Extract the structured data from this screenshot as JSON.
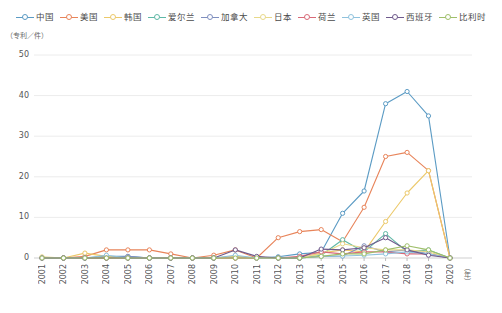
{
  "chart_data": {
    "type": "line",
    "title": "",
    "xlabel": "（年）",
    "ylabel": "（专利／件）",
    "ylim": [
      0,
      55
    ],
    "yticks": [
      0,
      10,
      20,
      30,
      40,
      50
    ],
    "grid": true,
    "legend_position": "top",
    "marker": "open-circle",
    "categories": [
      "2001",
      "2002",
      "2003",
      "2004",
      "2005",
      "2006",
      "2007",
      "2008",
      "2009",
      "2010",
      "2011",
      "2012",
      "2013",
      "2014",
      "2015",
      "2016",
      "2017",
      "2018",
      "2019",
      "2020"
    ],
    "series": [
      {
        "name": "中国",
        "color": "#5b9bc4",
        "values": [
          0,
          0,
          0,
          0.4,
          0.4,
          0,
          0,
          0,
          0,
          0.3,
          0,
          0.3,
          1,
          1.4,
          11,
          16.5,
          38,
          41,
          35,
          0
        ]
      },
      {
        "name": "美国",
        "color": "#e8845a",
        "values": [
          0,
          0,
          0.4,
          2,
          2,
          2,
          1,
          0,
          0.7,
          2,
          0,
          5,
          6.5,
          7,
          4,
          12.5,
          25,
          26,
          21.5,
          0
        ]
      },
      {
        "name": "韩国",
        "color": "#ecc96a",
        "values": [
          0,
          0,
          1.2,
          0.4,
          0,
          0,
          0,
          0,
          0,
          0.4,
          0,
          0,
          0,
          1.2,
          2,
          1.5,
          9,
          16,
          21.5,
          0
        ]
      },
      {
        "name": "爱尔兰",
        "color": "#5fb8a6",
        "values": [
          0,
          0,
          0,
          0,
          0,
          0,
          0,
          0,
          0,
          0,
          0,
          0,
          0,
          0.7,
          4.5,
          1.5,
          6,
          1.5,
          2,
          0
        ]
      },
      {
        "name": "加拿大",
        "color": "#7f8fbf",
        "values": [
          0,
          0,
          0,
          0,
          0.4,
          0,
          0,
          0,
          0,
          0,
          0,
          0,
          0,
          0.4,
          0.5,
          3,
          1.5,
          2,
          1,
          0
        ]
      },
      {
        "name": "日本",
        "color": "#e8d98a",
        "values": [
          0.3,
          0,
          0,
          0,
          0,
          0,
          0,
          0,
          0,
          0,
          0,
          0,
          0,
          1,
          3.5,
          2.5,
          2,
          2,
          1.5,
          0
        ]
      },
      {
        "name": "荷兰",
        "color": "#d96a78",
        "values": [
          0,
          0,
          0,
          0,
          0,
          0,
          0,
          0,
          0,
          0,
          0,
          0,
          0.4,
          1.5,
          1,
          1.5,
          1.5,
          1,
          1,
          0
        ]
      },
      {
        "name": "英国",
        "color": "#8fc2dd",
        "values": [
          0,
          0,
          0,
          0.7,
          0,
          0,
          0,
          0,
          0,
          0.7,
          0,
          0,
          0,
          0.4,
          0.5,
          0.7,
          1,
          1.5,
          1,
          0
        ]
      },
      {
        "name": "西班牙",
        "color": "#6f5a8c",
        "values": [
          0,
          0,
          0,
          0,
          0,
          0,
          0,
          0,
          0,
          2,
          0.4,
          0,
          0,
          2.2,
          2,
          2.5,
          5,
          2,
          0.7,
          0
        ]
      },
      {
        "name": "比利时",
        "color": "#9fbf6a",
        "values": [
          0,
          0,
          0,
          0,
          0,
          0,
          0,
          0,
          0,
          0,
          0,
          0,
          0,
          0.4,
          1,
          1,
          2,
          3,
          2,
          0
        ]
      }
    ]
  },
  "legend": {
    "items": [
      {
        "label": "中国"
      },
      {
        "label": "美国"
      },
      {
        "label": "韩国"
      },
      {
        "label": "爱尔兰"
      },
      {
        "label": "加拿大"
      },
      {
        "label": "日本"
      },
      {
        "label": "荷兰"
      },
      {
        "label": "英国"
      },
      {
        "label": "西班牙"
      },
      {
        "label": "比利时"
      }
    ]
  },
  "axes": {
    "y_unit_label": "（专利／件）",
    "x_unit_label": "（年）"
  }
}
